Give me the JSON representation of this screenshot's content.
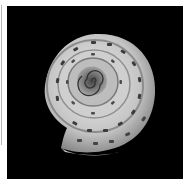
{
  "image": {
    "subject": "Snail shell viewed from above (apical view)",
    "background_color": "#000000",
    "shell_color_light": "#e6e6e6",
    "shell_color_mid": "#a8a8a8",
    "shell_color_dark": "#5a5a5a",
    "spot_color": "#3c3c3c"
  }
}
